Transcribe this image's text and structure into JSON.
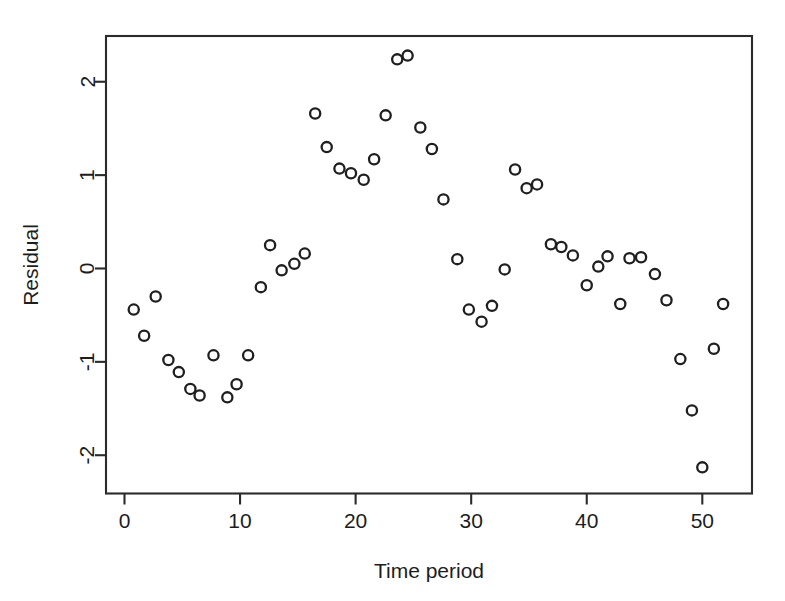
{
  "chart_data": {
    "type": "scatter",
    "title": "",
    "subtitle": "",
    "xlabel": "Time period",
    "ylabel": "Residual",
    "xlim": [
      -1.6,
      54.3
    ],
    "ylim": [
      -2.41,
      2.49
    ],
    "xticks": [
      0,
      10,
      20,
      30,
      40,
      50
    ],
    "yticks": [
      -2,
      -1,
      0,
      1,
      2
    ],
    "xticklabels": [
      "0",
      "10",
      "20",
      "30",
      "40",
      "50"
    ],
    "yticklabels": [
      "-2",
      "-1",
      "0",
      "1",
      "2"
    ],
    "grid": false,
    "legend": null,
    "marker": "open-circle",
    "marker_color": "#1f1f1f",
    "box_frame": true,
    "annotations": [],
    "n_points": 53,
    "x": [
      0.8,
      1.7,
      2.7,
      3.8,
      4.7,
      5.7,
      6.5,
      7.7,
      8.9,
      9.7,
      10.7,
      11.8,
      12.6,
      13.6,
      14.7,
      15.6,
      16.5,
      17.5,
      18.6,
      19.6,
      20.7,
      21.6,
      22.6,
      23.6,
      24.5,
      25.6,
      26.6,
      27.6,
      28.8,
      29.8,
      30.9,
      31.8,
      32.9,
      33.8,
      34.8,
      35.7,
      36.9,
      37.8,
      38.8,
      40.0,
      41.0,
      41.8,
      42.9,
      43.7,
      44.7,
      45.9,
      46.9,
      48.1,
      49.1,
      50.0,
      51.0,
      51.8
    ],
    "y": [
      -0.44,
      -0.72,
      -0.3,
      -0.98,
      -1.11,
      -1.29,
      -1.36,
      -0.93,
      -1.38,
      -1.24,
      -0.93,
      -0.2,
      0.25,
      -0.02,
      0.05,
      0.16,
      1.66,
      1.3,
      1.07,
      1.02,
      0.95,
      1.17,
      1.64,
      2.24,
      2.28,
      1.51,
      1.28,
      0.74,
      0.1,
      -0.44,
      -0.57,
      -0.4,
      -0.01,
      1.06,
      0.86,
      0.9,
      0.26,
      0.23,
      0.14,
      -0.18,
      0.02,
      0.13,
      -0.38,
      0.11,
      0.12,
      -0.06,
      -0.34,
      -0.97,
      -1.52,
      -2.13,
      -0.86,
      -0.38
    ]
  },
  "axes": {
    "x_axis_name": "Time period",
    "y_axis_name": "Residual"
  }
}
